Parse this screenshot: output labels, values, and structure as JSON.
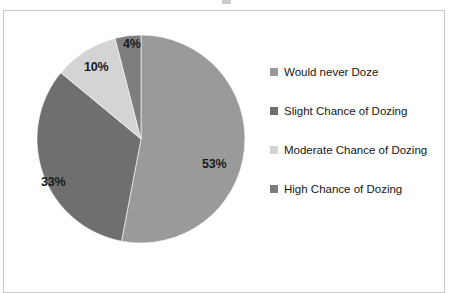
{
  "figure": {
    "background_color": "#ffffff",
    "border_color": "#c9c9c9"
  },
  "chart_data": {
    "type": "pie",
    "title": "",
    "subtitle": "",
    "xlabel": "",
    "ylabel": "",
    "legend_position": "right",
    "grid": false,
    "start_angle_deg": 0,
    "direction": "clockwise",
    "categories": [
      "Would never Doze",
      "Slight Chance of Dozing",
      "Moderate Chance of Dozing",
      "High Chance of Dozing"
    ],
    "values": [
      53,
      33,
      10,
      4
    ],
    "value_unit": "%",
    "data_labels": [
      "53%",
      "33%",
      "10%",
      "4%"
    ],
    "colors": [
      "#9a9a9a",
      "#6f6f6f",
      "#d4d4d4",
      "#7e7e7e"
    ],
    "slices": [
      {
        "label": "Would never Doze",
        "value": 53,
        "data_label": "53%",
        "color": "#9a9a9a"
      },
      {
        "label": "Slight Chance of Dozing",
        "value": 33,
        "data_label": "33%",
        "color": "#6f6f6f"
      },
      {
        "label": "Moderate Chance of Dozing",
        "value": 10,
        "data_label": "10%",
        "color": "#d4d4d4"
      },
      {
        "label": "High Chance of Dozing",
        "value": 4,
        "data_label": "4%",
        "color": "#7e7e7e"
      }
    ]
  },
  "legend": {
    "items": [
      {
        "label": "Would never Doze",
        "color": "#9a9a9a"
      },
      {
        "label": "Slight Chance of Dozing",
        "color": "#6f6f6f"
      },
      {
        "label": "Moderate Chance of Dozing",
        "color": "#d4d4d4"
      },
      {
        "label": "High Chance of Dozing",
        "color": "#7e7e7e"
      }
    ]
  }
}
